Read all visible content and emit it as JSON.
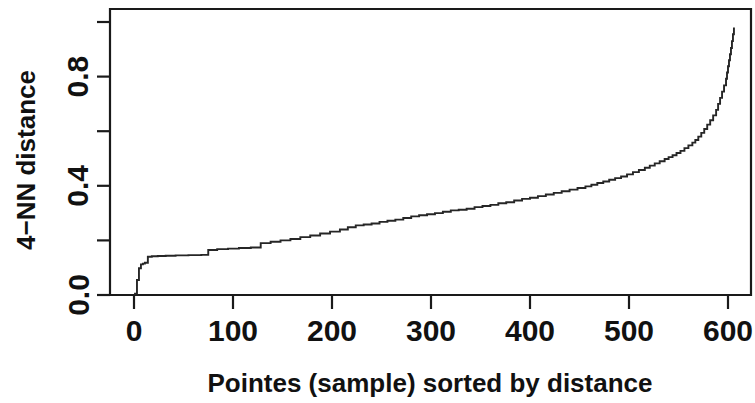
{
  "chart_data": {
    "type": "line",
    "title": "",
    "subtitle": "",
    "xlabel": "Pointes (sample) sorted by distance",
    "ylabel": "4−NN distance",
    "xlim": [
      -15,
      625
    ],
    "ylim": [
      0.0,
      1.04
    ],
    "grid": false,
    "legend": null,
    "x_ticks": [
      {
        "value": 0,
        "label": "0"
      },
      {
        "value": 100,
        "label": "100"
      },
      {
        "value": 200,
        "label": "200"
      },
      {
        "value": 300,
        "label": "300"
      },
      {
        "value": 400,
        "label": "400"
      },
      {
        "value": 500,
        "label": "500"
      },
      {
        "value": 600,
        "label": "600"
      }
    ],
    "y_ticks": [
      {
        "value": 0.0,
        "label": "0.0"
      },
      {
        "value": 0.2,
        "label": ""
      },
      {
        "value": 0.4,
        "label": "0.4"
      },
      {
        "value": 0.6,
        "label": ""
      },
      {
        "value": 0.8,
        "label": "0.8"
      },
      {
        "value": 1.0,
        "label": ""
      }
    ],
    "series": [
      {
        "name": "4-NN distance",
        "color": "#262626",
        "x": [
          1,
          3,
          5,
          7,
          9,
          11,
          14,
          18,
          24,
          32,
          42,
          55,
          68,
          75,
          84,
          95,
          106,
          118,
          128,
          138,
          148,
          158,
          168,
          178,
          188,
          198,
          208,
          216,
          224,
          232,
          240,
          248,
          256,
          264,
          272,
          280,
          288,
          296,
          304,
          312,
          320,
          328,
          336,
          344,
          352,
          360,
          368,
          376,
          384,
          392,
          400,
          408,
          416,
          424,
          432,
          440,
          448,
          456,
          462,
          468,
          474,
          480,
          486,
          492,
          498,
          504,
          510,
          516,
          521,
          526,
          531,
          536,
          540,
          544,
          548,
          552,
          556,
          560,
          564,
          567,
          570,
          573,
          576,
          579,
          582,
          585,
          588,
          590,
          592,
          594,
          596,
          598,
          599,
          600,
          601,
          602,
          603,
          604,
          605,
          606
        ],
        "y": [
          0.005,
          0.055,
          0.098,
          0.112,
          0.115,
          0.118,
          0.14,
          0.142,
          0.143,
          0.144,
          0.145,
          0.146,
          0.147,
          0.165,
          0.168,
          0.17,
          0.172,
          0.174,
          0.19,
          0.195,
          0.2,
          0.205,
          0.212,
          0.218,
          0.225,
          0.232,
          0.24,
          0.248,
          0.255,
          0.258,
          0.262,
          0.268,
          0.272,
          0.276,
          0.282,
          0.288,
          0.292,
          0.296,
          0.3,
          0.305,
          0.31,
          0.312,
          0.316,
          0.322,
          0.326,
          0.33,
          0.336,
          0.34,
          0.346,
          0.352,
          0.356,
          0.362,
          0.368,
          0.374,
          0.38,
          0.386,
          0.392,
          0.398,
          0.404,
          0.41,
          0.416,
          0.422,
          0.428,
          0.434,
          0.442,
          0.45,
          0.458,
          0.466,
          0.474,
          0.482,
          0.49,
          0.498,
          0.505,
          0.512,
          0.52,
          0.528,
          0.538,
          0.548,
          0.558,
          0.568,
          0.58,
          0.594,
          0.608,
          0.624,
          0.64,
          0.658,
          0.678,
          0.7,
          0.722,
          0.745,
          0.768,
          0.792,
          0.815,
          0.838,
          0.86,
          0.882,
          0.905,
          0.93,
          0.955,
          0.98
        ]
      }
    ],
    "annotations": []
  }
}
